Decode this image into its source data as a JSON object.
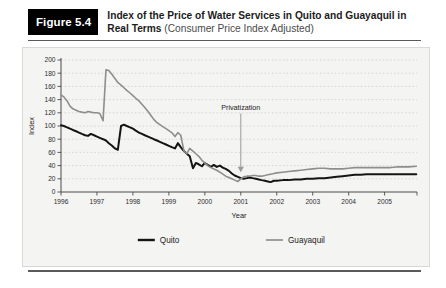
{
  "figure": {
    "badge_label": "Figure 5.4",
    "title_main": "Index of the Price of Water Services in Quito and Guayaquil in Real Terms ",
    "title_sub": "(Consumer Price Index Adjusted)"
  },
  "colors": {
    "quito": "#141414",
    "guayaquil": "#8e8e8e",
    "panel_bg": "#f4f4f2",
    "axis": "#4a4a4a",
    "gridline": "#c9c9c4",
    "annotation": "#9a9a9a",
    "badge_bg": "#000000"
  },
  "chart_data": {
    "type": "line",
    "title": "Index of the Price of Water Services in Quito and Guayaquil in Real Terms (Consumer Price Index Adjusted)",
    "xlabel": "Year",
    "ylabel": "Index",
    "xlim": [
      1996.0,
      2005.9
    ],
    "ylim": [
      0,
      200
    ],
    "yticks": [
      0,
      20,
      40,
      60,
      80,
      100,
      120,
      140,
      160,
      180,
      200
    ],
    "xticks": [
      1996,
      1997,
      1998,
      1999,
      2000,
      2001,
      2002,
      2003,
      2004,
      2005
    ],
    "xtick_labels": [
      "1996",
      "1997",
      "1998",
      "1999",
      "2000",
      "2001",
      "2002",
      "2003",
      "2004",
      "2005"
    ],
    "ytick_labels": [
      "0",
      "20",
      "40",
      "60",
      "80",
      "100",
      "120",
      "140",
      "160",
      "180",
      "200"
    ],
    "grid": true,
    "grid_style": "dotted-horizontal",
    "legend_position": "below",
    "annotations": [
      {
        "label": "Privatization",
        "x": 2001.0,
        "y_text": 122,
        "y_arrow_tip": 30,
        "style": "down-arrow"
      }
    ],
    "series": [
      {
        "name": "Quito",
        "color": "#141414",
        "width": 2.0,
        "x": [
          1996.0,
          1996.08,
          1996.17,
          1996.25,
          1996.33,
          1996.42,
          1996.5,
          1996.58,
          1996.67,
          1996.75,
          1996.83,
          1996.92,
          1997.0,
          1997.08,
          1997.17,
          1997.25,
          1997.33,
          1997.42,
          1997.5,
          1997.58,
          1997.67,
          1997.75,
          1997.83,
          1997.92,
          1998.0,
          1998.08,
          1998.17,
          1998.25,
          1998.33,
          1998.42,
          1998.5,
          1998.58,
          1998.67,
          1998.75,
          1998.83,
          1998.92,
          1999.0,
          1999.08,
          1999.17,
          1999.25,
          1999.33,
          1999.42,
          1999.5,
          1999.58,
          1999.67,
          1999.75,
          1999.83,
          1999.92,
          2000.0,
          2000.08,
          2000.17,
          2000.25,
          2000.33,
          2000.42,
          2000.5,
          2000.58,
          2000.67,
          2000.75,
          2000.83,
          2000.92,
          2001.0,
          2001.08,
          2001.17,
          2001.25,
          2001.33,
          2001.42,
          2001.5,
          2001.58,
          2001.67,
          2001.75,
          2001.83,
          2001.92,
          2002.0,
          2002.17,
          2002.33,
          2002.5,
          2002.67,
          2002.83,
          2003.0,
          2003.17,
          2003.33,
          2003.5,
          2003.67,
          2003.83,
          2004.0,
          2004.17,
          2004.33,
          2004.5,
          2004.67,
          2004.83,
          2005.0,
          2005.17,
          2005.33,
          2005.5,
          2005.67,
          2005.88
        ],
        "y": [
          101,
          100,
          98,
          96,
          94,
          92,
          90,
          88,
          86,
          85,
          88,
          86,
          84,
          82,
          80,
          78,
          74,
          70,
          66,
          64,
          100,
          102,
          100,
          98,
          96,
          93,
          90,
          88,
          86,
          84,
          82,
          80,
          78,
          76,
          74,
          72,
          70,
          68,
          66,
          74,
          68,
          62,
          58,
          54,
          36,
          44,
          42,
          39,
          44,
          41,
          38,
          41,
          38,
          40,
          37,
          35,
          32,
          28,
          25,
          23,
          21,
          20,
          21,
          22,
          21,
          20,
          19,
          18,
          17,
          16,
          15,
          17,
          17,
          18,
          18,
          19,
          19,
          20,
          20,
          21,
          21,
          22,
          23,
          24,
          25,
          26,
          26,
          27,
          27,
          27,
          27,
          27,
          27,
          27,
          27,
          27
        ]
      },
      {
        "name": "Guayaquil",
        "color": "#8e8e8e",
        "width": 1.6,
        "x": [
          1996.0,
          1996.08,
          1996.17,
          1996.25,
          1996.33,
          1996.42,
          1996.5,
          1996.58,
          1996.67,
          1996.75,
          1996.83,
          1996.92,
          1997.0,
          1997.08,
          1997.17,
          1997.25,
          1997.33,
          1997.42,
          1997.5,
          1997.58,
          1997.67,
          1997.75,
          1997.83,
          1997.92,
          1998.0,
          1998.08,
          1998.17,
          1998.25,
          1998.33,
          1998.42,
          1998.5,
          1998.58,
          1998.67,
          1998.75,
          1998.83,
          1998.92,
          1999.0,
          1999.08,
          1999.17,
          1999.25,
          1999.33,
          1999.42,
          1999.5,
          1999.58,
          1999.67,
          1999.75,
          1999.83,
          1999.92,
          2000.0,
          2000.08,
          2000.17,
          2000.25,
          2000.33,
          2000.42,
          2000.5,
          2000.58,
          2000.67,
          2000.75,
          2000.83,
          2000.92,
          2001.0,
          2001.08,
          2001.17,
          2001.25,
          2001.33,
          2001.42,
          2001.5,
          2001.58,
          2001.67,
          2001.75,
          2001.83,
          2001.92,
          2002.0,
          2002.17,
          2002.33,
          2002.5,
          2002.67,
          2002.83,
          2003.0,
          2003.17,
          2003.33,
          2003.5,
          2003.67,
          2003.83,
          2004.0,
          2004.17,
          2004.33,
          2004.5,
          2004.67,
          2004.83,
          2005.0,
          2005.17,
          2005.33,
          2005.5,
          2005.67,
          2005.88
        ],
        "y": [
          147,
          144,
          138,
          130,
          126,
          124,
          122,
          121,
          120,
          122,
          121,
          120,
          120,
          119,
          108,
          185,
          184,
          178,
          172,
          166,
          162,
          158,
          154,
          150,
          146,
          142,
          138,
          133,
          128,
          122,
          116,
          110,
          105,
          102,
          99,
          96,
          93,
          90,
          84,
          90,
          86,
          62,
          58,
          66,
          62,
          58,
          54,
          48,
          44,
          40,
          37,
          35,
          33,
          30,
          27,
          24,
          22,
          20,
          18,
          16,
          20,
          23,
          24,
          24,
          25,
          25,
          24,
          24,
          25,
          26,
          27,
          28,
          29,
          30,
          31,
          32,
          33,
          34,
          35,
          36,
          36,
          35,
          35,
          35,
          36,
          37,
          37,
          37,
          37,
          37,
          37,
          37,
          38,
          38,
          38,
          39
        ]
      }
    ]
  },
  "legend": {
    "items": [
      {
        "label": "Quito",
        "color": "#141414"
      },
      {
        "label": "Guayaquil",
        "color": "#8e8e8e"
      }
    ]
  }
}
